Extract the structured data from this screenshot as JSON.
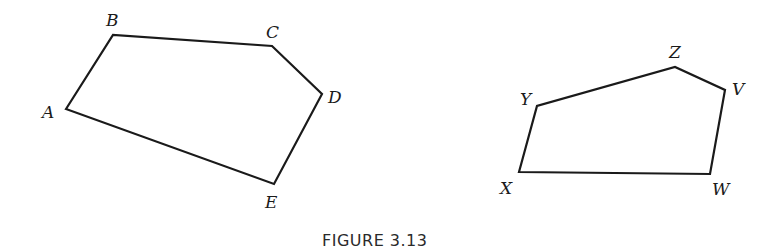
{
  "figure": {
    "caption": "FIGURE 3.13",
    "polygons": [
      {
        "name": "pentagon-ABCDE",
        "vertices": [
          {
            "label": "A",
            "x": 66,
            "y": 109,
            "lx": 42,
            "ly": 118
          },
          {
            "label": "B",
            "x": 113,
            "y": 35,
            "lx": 106,
            "ly": 26
          },
          {
            "label": "C",
            "x": 272,
            "y": 46,
            "lx": 266,
            "ly": 38
          },
          {
            "label": "D",
            "x": 322,
            "y": 94,
            "lx": 328,
            "ly": 103
          },
          {
            "label": "E",
            "x": 274,
            "y": 184,
            "lx": 265,
            "ly": 208
          }
        ]
      },
      {
        "name": "pentagon-VWXYZ",
        "vertices": [
          {
            "label": "X",
            "x": 519,
            "y": 172,
            "lx": 500,
            "ly": 194
          },
          {
            "label": "Y",
            "x": 537,
            "y": 106,
            "lx": 520,
            "ly": 105
          },
          {
            "label": "Z",
            "x": 675,
            "y": 67,
            "lx": 669,
            "ly": 58
          },
          {
            "label": "V",
            "x": 725,
            "y": 90,
            "lx": 732,
            "ly": 95
          },
          {
            "label": "W",
            "x": 710,
            "y": 174,
            "lx": 712,
            "ly": 195
          }
        ]
      }
    ]
  }
}
